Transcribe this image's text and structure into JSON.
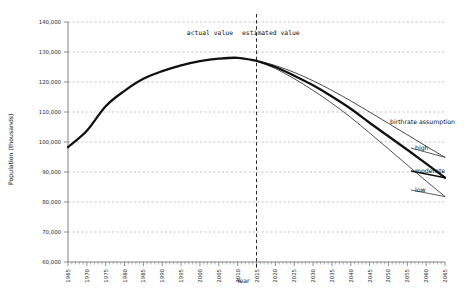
{
  "chart_data": {
    "type": "line",
    "title": "",
    "xlabel": "Year",
    "ylabel": "Population (thousands)",
    "xlim": [
      1965,
      2065
    ],
    "ylim": [
      60000,
      140000
    ],
    "grid": true,
    "y_tick_labels": [
      "140,000",
      "130,000",
      "120,000",
      "110,000",
      "100,000",
      "90,000",
      "80,000",
      "70,000",
      "60,000"
    ],
    "y_ticks": [
      140000,
      130000,
      120000,
      110000,
      100000,
      90000,
      80000,
      70000,
      60000
    ],
    "x_ticks": [
      1965,
      1970,
      1975,
      1980,
      1985,
      1990,
      1995,
      2000,
      2005,
      2010,
      2015,
      2020,
      2025,
      2030,
      2035,
      2040,
      2045,
      2050,
      2055,
      2060,
      2065
    ],
    "x_tick_labels": [
      "1965",
      "1970",
      "1975",
      "1980",
      "1985",
      "1990",
      "1995",
      "2000",
      "2005",
      "2010",
      "2015",
      "2020",
      "2025",
      "2030",
      "2035",
      "2040",
      "2045",
      "2050",
      "2055",
      "2060",
      "2065"
    ],
    "divider_year": 2015,
    "annotations": [
      {
        "text": "actual value",
        "x": 2015,
        "align": "right"
      },
      {
        "text": "estimated value",
        "x": 2015,
        "align": "left"
      }
    ],
    "legend_title": "birthrate assumption",
    "legend_position": "right-inline",
    "series": [
      {
        "name": "actual",
        "label": "",
        "style": "thick",
        "x": [
          1965,
          1970,
          1975,
          1980,
          1985,
          1990,
          1995,
          2000,
          2005,
          2010,
          2015
        ],
        "values": [
          98275,
          103720,
          111940,
          117060,
          121049,
          123611,
          125570,
          126926,
          127768,
          128057,
          127095
        ]
      },
      {
        "name": "high",
        "label": "high",
        "style": "thin",
        "x": [
          2015,
          2020,
          2025,
          2030,
          2035,
          2040,
          2045,
          2050,
          2055,
          2060,
          2065
        ],
        "values": [
          127095,
          125500,
          123200,
          120400,
          117200,
          113700,
          110000,
          106200,
          102400,
          98600,
          94900
        ]
      },
      {
        "name": "moderate",
        "label": "moderate",
        "style": "thick",
        "x": [
          2015,
          2020,
          2025,
          2030,
          2035,
          2040,
          2045,
          2050,
          2055,
          2060,
          2065
        ],
        "values": [
          127095,
          125000,
          122100,
          118900,
          115200,
          111100,
          106400,
          101900,
          97400,
          92800,
          88100
        ]
      },
      {
        "name": "low",
        "label": "low",
        "style": "thin",
        "x": [
          2015,
          2020,
          2025,
          2030,
          2035,
          2040,
          2045,
          2050,
          2055,
          2060,
          2065
        ],
        "values": [
          127095,
          124500,
          121100,
          117200,
          112900,
          108200,
          103000,
          97700,
          92300,
          87000,
          81800
        ]
      }
    ]
  },
  "colors": {
    "line": "#111111",
    "grid": "#b8b8b8",
    "axis": "#808080",
    "text": "#1a1a1a",
    "background": "#ffffff"
  }
}
